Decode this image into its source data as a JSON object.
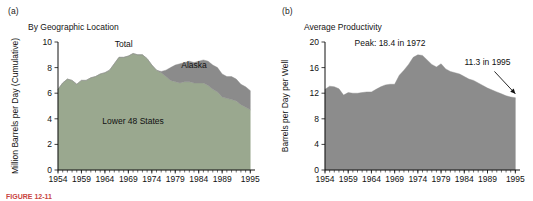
{
  "figure": {
    "caption": "FIGURE 12-11"
  },
  "panels": [
    {
      "letter": "(a)",
      "title": "By Geographic Location"
    },
    {
      "letter": "(b)",
      "title": "Average Productivity"
    }
  ],
  "chart_data": [
    {
      "type": "area",
      "title": "By Geographic Location",
      "panel": "(a)",
      "xlabel": "",
      "ylabel": "Million Barrels per Day (Cumulative)",
      "xlim": [
        1954,
        1996
      ],
      "ylim": [
        0,
        10
      ],
      "yticks": [
        0,
        2,
        4,
        6,
        8,
        10
      ],
      "xticks": [
        1954,
        1959,
        1964,
        1969,
        1974,
        1979,
        1984,
        1989,
        1995
      ],
      "grid": false,
      "legend": "inline-labels",
      "annotations": [
        {
          "text": "Total",
          "x": 1968,
          "y": 9.6
        },
        {
          "text": "Alaska",
          "x": 1983,
          "y": 8.0
        },
        {
          "text": "Lower 48 States",
          "x": 1970,
          "y": 3.6
        }
      ],
      "colors": {
        "lower48": "#9aa88f",
        "alaska": "#8b8b8b"
      },
      "x": [
        1954,
        1955,
        1956,
        1957,
        1958,
        1959,
        1960,
        1961,
        1962,
        1963,
        1964,
        1965,
        1966,
        1967,
        1968,
        1969,
        1970,
        1971,
        1972,
        1973,
        1974,
        1975,
        1976,
        1977,
        1978,
        1979,
        1980,
        1981,
        1982,
        1983,
        1984,
        1985,
        1986,
        1987,
        1988,
        1989,
        1990,
        1991,
        1992,
        1993,
        1994,
        1995
      ],
      "series": [
        {
          "name": "Lower 48 States",
          "values": [
            6.3,
            6.8,
            7.1,
            7.0,
            6.7,
            7.0,
            7.0,
            7.2,
            7.3,
            7.5,
            7.6,
            7.8,
            8.3,
            8.8,
            8.8,
            8.9,
            9.1,
            9.0,
            9.0,
            8.7,
            8.2,
            7.8,
            7.6,
            7.3,
            7.0,
            6.9,
            6.8,
            6.9,
            6.9,
            6.8,
            6.8,
            6.8,
            6.6,
            6.3,
            6.1,
            5.7,
            5.6,
            5.5,
            5.4,
            5.1,
            4.9,
            4.7
          ]
        },
        {
          "name": "Alaska",
          "values": [
            0.0,
            0.0,
            0.0,
            0.0,
            0.0,
            0.0,
            0.0,
            0.0,
            0.0,
            0.0,
            0.0,
            0.0,
            0.0,
            0.0,
            0.0,
            0.0,
            0.0,
            0.0,
            0.0,
            0.0,
            0.0,
            0.0,
            0.1,
            0.5,
            1.0,
            1.3,
            1.5,
            1.5,
            1.6,
            1.6,
            1.7,
            1.8,
            1.9,
            1.9,
            1.9,
            1.8,
            1.7,
            1.8,
            1.7,
            1.6,
            1.6,
            1.5
          ]
        }
      ]
    },
    {
      "type": "area",
      "title": "Average Productivity",
      "panel": "(b)",
      "xlabel": "",
      "ylabel": "Barrels per Day per Well",
      "xlim": [
        1954,
        1996
      ],
      "ylim": [
        0,
        20
      ],
      "yticks": [
        0,
        4,
        8,
        12,
        16,
        20
      ],
      "xticks": [
        1954,
        1959,
        1964,
        1969,
        1974,
        1979,
        1984,
        1989,
        1995
      ],
      "grid": false,
      "legend": "none",
      "annotations": [
        {
          "text": "Peak: 18.4 in 1972",
          "x": 1968,
          "y": 19.3
        },
        {
          "text": "11.3 in 1995",
          "x": 1989,
          "y": 16.4
        }
      ],
      "colors": {
        "productivity": "#8c8c8c"
      },
      "x": [
        1954,
        1955,
        1956,
        1957,
        1958,
        1959,
        1960,
        1961,
        1962,
        1963,
        1964,
        1965,
        1966,
        1967,
        1968,
        1969,
        1970,
        1971,
        1972,
        1973,
        1974,
        1975,
        1976,
        1977,
        1978,
        1979,
        1980,
        1981,
        1982,
        1983,
        1984,
        1985,
        1986,
        1987,
        1988,
        1989,
        1990,
        1991,
        1992,
        1993,
        1994,
        1995
      ],
      "values": [
        12.6,
        13.1,
        13.0,
        12.7,
        11.7,
        12.1,
        12.0,
        12.0,
        12.1,
        12.2,
        12.2,
        12.6,
        13.0,
        13.3,
        13.4,
        13.4,
        14.8,
        15.6,
        16.5,
        17.6,
        18.0,
        17.9,
        17.2,
        16.5,
        16.1,
        16.6,
        15.8,
        15.4,
        15.2,
        15.0,
        14.6,
        14.2,
        14.0,
        13.6,
        13.2,
        12.8,
        12.5,
        12.2,
        11.9,
        11.6,
        11.4,
        11.3
      ],
      "peak": {
        "label": "Peak: 18.4 in 1972",
        "value": 18.4,
        "year": 1972
      },
      "last": {
        "label": "11.3 in 1995",
        "value": 11.3,
        "year": 1995
      }
    }
  ]
}
